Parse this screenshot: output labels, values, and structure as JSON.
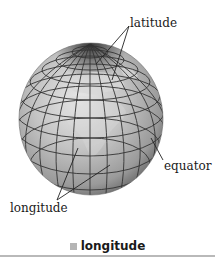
{
  "figure": {
    "labels": {
      "latitude": "latitude",
      "equator": "equator",
      "longitude": "longitude"
    },
    "caption": {
      "text": "longitude",
      "swatch_color": "#b5b5b5"
    },
    "colors": {
      "globe_light": "#e6e6e6",
      "globe_mid": "#a8a8a8",
      "globe_dark": "#4a4a4a",
      "grid_lines": "#333333",
      "land": "#d6d6d6",
      "rule": "#b9b9b9"
    }
  }
}
